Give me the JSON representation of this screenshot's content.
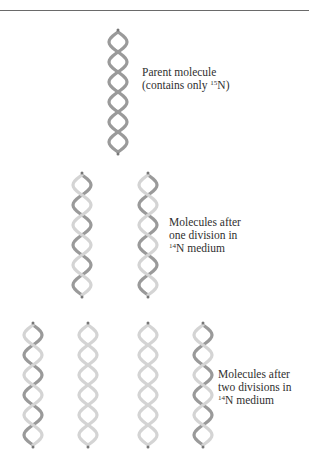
{
  "figure": {
    "colors": {
      "heavy_strand": "#9a9a9a",
      "light_strand": "#d4d4d4",
      "rule": "#6a6a6a",
      "text": "#2f2f2f"
    },
    "rows": [
      {
        "id": "parent",
        "label_line1": "Parent molecule",
        "label_line2_prefix": "(contains only ",
        "label_line2_isotope_mass": "15",
        "label_line2_suffix": "N)",
        "molecules": [
          {
            "strands": [
              "15N",
              "15N"
            ]
          }
        ]
      },
      {
        "id": "first-division",
        "label_line1": "Molecules after",
        "label_line2": "one division in",
        "label_line3_isotope_mass": "14",
        "label_line3_suffix": "N medium",
        "molecules": [
          {
            "strands": [
              "15N",
              "14N"
            ]
          },
          {
            "strands": [
              "15N",
              "14N"
            ]
          }
        ]
      },
      {
        "id": "second-division",
        "label_line1": "Molecules after",
        "label_line2": "two divisions in",
        "label_line3_isotope_mass": "14",
        "label_line3_suffix": "N medium",
        "molecules": [
          {
            "strands": [
              "15N",
              "14N"
            ]
          },
          {
            "strands": [
              "14N",
              "14N"
            ]
          },
          {
            "strands": [
              "14N",
              "14N"
            ]
          },
          {
            "strands": [
              "15N",
              "14N"
            ]
          }
        ]
      }
    ]
  }
}
